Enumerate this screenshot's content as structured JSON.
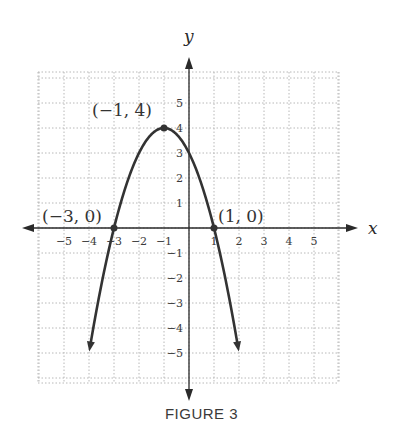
{
  "caption": "FIGURE 3",
  "chart_data": {
    "type": "line",
    "title": "",
    "xlabel": "x",
    "ylabel": "y",
    "function": "y = -(x+1)^2 + 4",
    "xlim": [
      -6,
      6
    ],
    "ylim": [
      -6,
      6
    ],
    "grid": true,
    "x_ticks": [
      -5,
      -4,
      -3,
      -2,
      -1,
      1,
      2,
      3,
      4,
      5
    ],
    "y_ticks": [
      -5,
      -4,
      -3,
      -2,
      -1,
      1,
      2,
      3,
      4,
      5
    ],
    "x_tick_labels": [
      "−5",
      "−4",
      "−3",
      "−2",
      "−1",
      "1",
      "2",
      "3",
      "4",
      "5"
    ],
    "y_tick_labels": [
      "−5",
      "−4",
      "−3",
      "−2",
      "−1",
      "1",
      "2",
      "3",
      "4",
      "5"
    ],
    "series": [
      {
        "name": "parabola",
        "x": [
          -3.95,
          -3.5,
          -3,
          -2.5,
          -2,
          -1.5,
          -1,
          -0.5,
          0,
          0.5,
          1,
          1.5,
          1.95
        ],
        "y": [
          -4.7,
          -2.25,
          0,
          1.75,
          3,
          3.75,
          4,
          3.75,
          3,
          1.75,
          0,
          -2.25,
          -4.7
        ]
      }
    ],
    "points": [
      {
        "x": -1,
        "y": 4,
        "label": "(−1, 4)"
      },
      {
        "x": -3,
        "y": 0,
        "label": "(−3, 0)"
      },
      {
        "x": 1,
        "y": 0,
        "label": "(1, 0)"
      }
    ]
  }
}
